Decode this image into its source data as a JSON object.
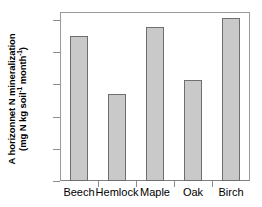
{
  "chart_data": {
    "type": "bar",
    "title": "",
    "xlabel": "",
    "ylabel": "A horizonnet N mineralization (mg N kg soil-1 month-1)",
    "ylabel_line1": "A horizonnet N mineralization",
    "ylabel_line2_prefix": "(mg N kg soil",
    "ylabel_line2_sup1": "-1",
    "ylabel_line2_mid": " month",
    "ylabel_line2_sup2": "-1",
    "ylabel_line2_suffix": ")",
    "categories": [
      "Beech",
      "Hemlock",
      "Maple",
      "Oak",
      "Birch"
    ],
    "values": [
      90,
      54,
      96,
      62.5,
      101
    ],
    "ylim": [
      0,
      105
    ],
    "yticks": [
      0,
      20,
      40,
      60,
      80,
      100
    ],
    "ytick_labels": [
      "0",
      "20",
      "40",
      "60",
      "80",
      "100"
    ],
    "grid": false,
    "legend": false,
    "bar_color": "#c9c9c9",
    "bar_border_color": "#6e6e6e",
    "axis_color": "#8c8c8c",
    "frame_color": "#9a9a9a",
    "text_color": "#000000"
  }
}
